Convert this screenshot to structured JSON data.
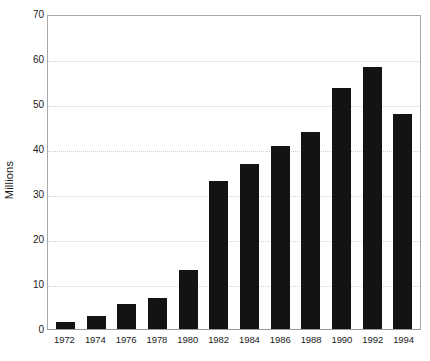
{
  "chart_data": {
    "type": "bar",
    "title": "",
    "subtitle": "",
    "xlabel": "",
    "ylabel": "Millions",
    "categories": [
      "1972",
      "1974",
      "1976",
      "1978",
      "1980",
      "1982",
      "1984",
      "1986",
      "1988",
      "1990",
      "1992",
      "1994"
    ],
    "values": [
      1.5,
      3.0,
      5.5,
      7.0,
      13.3,
      33.0,
      37.0,
      41.0,
      44.0,
      54.0,
      58.7,
      48.0
    ],
    "ylim": [
      0,
      70
    ],
    "yticks": [
      0,
      10,
      20,
      30,
      40,
      50,
      60,
      70
    ],
    "ytick_labels": [
      "0",
      "10",
      "20",
      "30",
      "40",
      "50",
      "60",
      "70"
    ],
    "grid": true,
    "grid_axis": "y",
    "legend": false,
    "legend_position": "none",
    "bar_color": "#131313",
    "grid_color": "#cfcfcf",
    "axis_color": "#a8a8a8",
    "background_color": "#ffffff",
    "text_color": "#1a1a1a"
  }
}
